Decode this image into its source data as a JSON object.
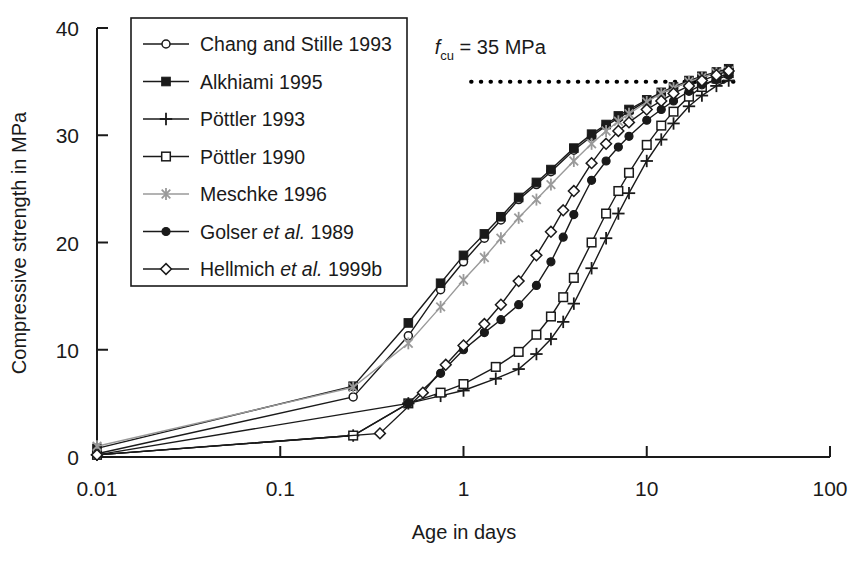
{
  "chart_data": {
    "type": "line",
    "title": "",
    "xlabel": "Age in days",
    "ylabel": "Compressive strength in MPa",
    "xscale": "log",
    "xlim": [
      0.01,
      100
    ],
    "ylim": [
      0,
      40
    ],
    "xticks": [
      0.01,
      0.1,
      1,
      10,
      100
    ],
    "xtick_labels": [
      "0.01",
      "0.1",
      "1",
      "10",
      "100"
    ],
    "yticks": [
      0,
      10,
      20,
      30,
      40
    ],
    "ytick_labels": [
      "0",
      "10",
      "20",
      "30",
      "40"
    ],
    "grid": false,
    "legend_position": "upper-left-inside",
    "annotations": [
      {
        "name": "fcu-reference-label",
        "text": "f_cu = 35 MPa",
        "text_main": "f",
        "text_sub": "cu",
        "text_rest": " = 35 MPa",
        "value": 35,
        "units": "MPa",
        "x_data": 1.4,
        "y_data": 37.6
      }
    ],
    "reference_lines": [
      {
        "name": "fcu-dotted-line",
        "orientation": "horizontal",
        "y": 35,
        "x_start": 1.1,
        "x_end": 33,
        "style": "dotted",
        "color": "#000000"
      }
    ],
    "series": [
      {
        "name": "Chang and Stille 1993",
        "marker": "circle-open",
        "color": "#1a1a1a",
        "points": [
          [
            0.01,
            0.3
          ],
          [
            0.25,
            5.6
          ],
          [
            0.5,
            11.3
          ],
          [
            0.75,
            15.6
          ],
          [
            1.0,
            18.2
          ],
          [
            1.3,
            20.4
          ],
          [
            1.6,
            22.1
          ],
          [
            2.0,
            24.0
          ],
          [
            2.5,
            25.4
          ],
          [
            3.0,
            26.6
          ],
          [
            4.0,
            28.6
          ],
          [
            5.0,
            29.9
          ],
          [
            6.0,
            30.9
          ],
          [
            7.0,
            31.6
          ],
          [
            8.0,
            32.2
          ],
          [
            10.0,
            33.2
          ],
          [
            12.0,
            33.9
          ],
          [
            14.0,
            34.4
          ],
          [
            17.0,
            35.0
          ],
          [
            20.0,
            35.4
          ],
          [
            24.0,
            35.8
          ],
          [
            28.0,
            36.1
          ]
        ]
      },
      {
        "name": "Alkhiami 1995",
        "marker": "square-filled",
        "color": "#1a1a1a",
        "points": [
          [
            0.01,
            0.8
          ],
          [
            0.25,
            6.6
          ],
          [
            0.5,
            12.5
          ],
          [
            0.75,
            16.2
          ],
          [
            1.0,
            18.8
          ],
          [
            1.3,
            20.8
          ],
          [
            1.6,
            22.4
          ],
          [
            2.0,
            24.2
          ],
          [
            2.5,
            25.6
          ],
          [
            3.0,
            26.8
          ],
          [
            4.0,
            28.8
          ],
          [
            5.0,
            30.1
          ],
          [
            6.0,
            31.0
          ],
          [
            7.0,
            31.8
          ],
          [
            8.0,
            32.4
          ],
          [
            10.0,
            33.3
          ],
          [
            12.0,
            34.0
          ],
          [
            14.0,
            34.5
          ],
          [
            17.0,
            35.1
          ],
          [
            20.0,
            35.5
          ],
          [
            24.0,
            35.9
          ],
          [
            28.0,
            36.2
          ]
        ]
      },
      {
        "name": "Pöttler 1993",
        "marker": "plus",
        "color": "#1a1a1a",
        "points": [
          [
            0.01,
            0.2
          ],
          [
            0.25,
            2.0
          ],
          [
            0.5,
            5.0
          ],
          [
            0.75,
            5.7
          ],
          [
            1.0,
            6.2
          ],
          [
            1.5,
            7.3
          ],
          [
            2.0,
            8.2
          ],
          [
            2.5,
            9.6
          ],
          [
            3.0,
            11.0
          ],
          [
            3.5,
            12.6
          ],
          [
            4.0,
            14.3
          ],
          [
            5.0,
            17.6
          ],
          [
            6.0,
            20.4
          ],
          [
            7.0,
            22.7
          ],
          [
            8.0,
            24.6
          ],
          [
            10.0,
            27.6
          ],
          [
            12.0,
            29.6
          ],
          [
            14.0,
            31.1
          ],
          [
            17.0,
            32.7
          ],
          [
            20.0,
            33.7
          ],
          [
            24.0,
            34.6
          ],
          [
            28.0,
            35.1
          ]
        ]
      },
      {
        "name": "Pöttler 1990",
        "marker": "square-open",
        "color": "#1a1a1a",
        "points": [
          [
            0.01,
            0.2
          ],
          [
            0.25,
            2.0
          ],
          [
            0.5,
            5.0
          ],
          [
            0.75,
            6.0
          ],
          [
            1.0,
            6.8
          ],
          [
            1.5,
            8.4
          ],
          [
            2.0,
            9.8
          ],
          [
            2.5,
            11.4
          ],
          [
            3.0,
            13.1
          ],
          [
            3.5,
            14.9
          ],
          [
            4.0,
            16.7
          ],
          [
            5.0,
            20.0
          ],
          [
            6.0,
            22.7
          ],
          [
            7.0,
            24.8
          ],
          [
            8.0,
            26.5
          ],
          [
            10.0,
            29.1
          ],
          [
            12.0,
            30.9
          ],
          [
            14.0,
            32.2
          ],
          [
            17.0,
            33.6
          ],
          [
            20.0,
            34.5
          ],
          [
            24.0,
            35.3
          ],
          [
            28.0,
            35.8
          ]
        ]
      },
      {
        "name": "Meschke 1996",
        "marker": "asterisk",
        "color": "#9a9a9a",
        "points": [
          [
            0.01,
            1.0
          ],
          [
            0.25,
            6.5
          ],
          [
            0.5,
            10.6
          ],
          [
            0.75,
            14.0
          ],
          [
            1.0,
            16.5
          ],
          [
            1.3,
            18.6
          ],
          [
            1.6,
            20.4
          ],
          [
            2.0,
            22.3
          ],
          [
            2.5,
            24.0
          ],
          [
            3.0,
            25.4
          ],
          [
            4.0,
            27.6
          ],
          [
            5.0,
            29.2
          ],
          [
            6.0,
            30.4
          ],
          [
            7.0,
            31.3
          ],
          [
            8.0,
            32.0
          ],
          [
            10.0,
            33.1
          ],
          [
            12.0,
            33.9
          ],
          [
            14.0,
            34.4
          ],
          [
            17.0,
            35.0
          ],
          [
            20.0,
            35.4
          ],
          [
            24.0,
            35.8
          ],
          [
            28.0,
            36.0
          ]
        ]
      },
      {
        "name": "Golser et al. 1989",
        "marker": "circle-filled",
        "color": "#1a1a1a",
        "points": [
          [
            0.01,
            0.2
          ],
          [
            0.5,
            5.0
          ],
          [
            0.75,
            7.8
          ],
          [
            1.0,
            10.0
          ],
          [
            1.3,
            11.6
          ],
          [
            1.6,
            12.8
          ],
          [
            2.0,
            14.2
          ],
          [
            2.5,
            16.0
          ],
          [
            3.0,
            18.2
          ],
          [
            3.5,
            20.5
          ],
          [
            4.0,
            22.6
          ],
          [
            5.0,
            25.8
          ],
          [
            6.0,
            27.6
          ],
          [
            7.0,
            28.9
          ],
          [
            8.0,
            29.9
          ],
          [
            10.0,
            31.4
          ],
          [
            12.0,
            32.4
          ],
          [
            14.0,
            33.2
          ],
          [
            17.0,
            34.1
          ],
          [
            20.0,
            34.7
          ],
          [
            24.0,
            35.2
          ],
          [
            28.0,
            35.6
          ]
        ]
      },
      {
        "name": "Hellmich et al. 1999b",
        "marker": "diamond-open",
        "color": "#1a1a1a",
        "points": [
          [
            0.01,
            0.2
          ],
          [
            0.35,
            2.2
          ],
          [
            0.6,
            6.0
          ],
          [
            0.8,
            8.6
          ],
          [
            1.0,
            10.4
          ],
          [
            1.3,
            12.4
          ],
          [
            1.6,
            14.2
          ],
          [
            2.0,
            16.4
          ],
          [
            2.5,
            18.8
          ],
          [
            3.0,
            21.0
          ],
          [
            3.5,
            23.0
          ],
          [
            4.0,
            24.8
          ],
          [
            5.0,
            27.4
          ],
          [
            6.0,
            29.2
          ],
          [
            7.0,
            30.4
          ],
          [
            8.0,
            31.2
          ],
          [
            10.0,
            32.4
          ],
          [
            12.0,
            33.2
          ],
          [
            14.0,
            33.9
          ],
          [
            17.0,
            34.6
          ],
          [
            20.0,
            35.1
          ],
          [
            24.0,
            35.6
          ],
          [
            28.0,
            36.0
          ]
        ]
      }
    ]
  },
  "legend": {
    "items": [
      {
        "label": "Chang and Stille 1993",
        "marker": "circle-open"
      },
      {
        "label": "Alkhiami 1995",
        "marker": "square-filled"
      },
      {
        "label": "Pöttler 1993",
        "marker": "plus"
      },
      {
        "label": "Pöttler 1990",
        "marker": "square-open"
      },
      {
        "label": "Meschke 1996",
        "marker": "asterisk"
      },
      {
        "label": "Golser et al. 1989",
        "marker": "circle-filled",
        "italic_part": "et al."
      },
      {
        "label": "Hellmich et al. 1999b",
        "marker": "diamond-open",
        "italic_part": "et al."
      }
    ]
  },
  "colors": {
    "axis": "#1a1a1a",
    "text": "#1a1a1a",
    "background": "#ffffff",
    "meschke_gray": "#9a9a9a"
  }
}
